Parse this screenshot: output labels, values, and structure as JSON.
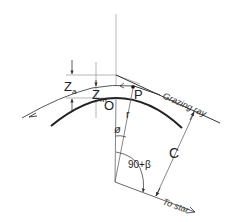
{
  "diagram": {
    "type": "geometry",
    "title": "",
    "labels": {
      "z_a": "Z",
      "z_a_sub": "a",
      "z_m": "Z",
      "z_m_sub": "m",
      "origin": "O",
      "point_p": "P",
      "radius": "r",
      "angle_phi": "ø",
      "angle_90_beta": "90+β",
      "chord": "C",
      "grazing_ray": "Grazing ray",
      "to_star": "To star"
    },
    "colors": {
      "line": "#333333",
      "thin_line": "#888888",
      "background": "#ffffff"
    }
  }
}
